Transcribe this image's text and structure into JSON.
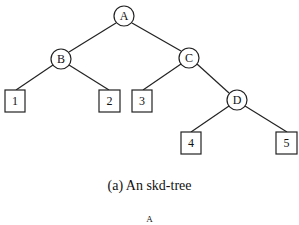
{
  "diagram": {
    "title": "An skd-tree",
    "caption": "(a) An skd-tree",
    "internal_nodes": [
      {
        "id": "A",
        "label": "A",
        "cx": 124,
        "cy": 16
      },
      {
        "id": "B",
        "label": "B",
        "cx": 61,
        "cy": 59
      },
      {
        "id": "C",
        "label": "C",
        "cx": 189,
        "cy": 58
      },
      {
        "id": "D",
        "label": "D",
        "cx": 237,
        "cy": 100
      }
    ],
    "leaf_nodes": [
      {
        "id": "1",
        "label": "1",
        "x": 4,
        "y": 90
      },
      {
        "id": "2",
        "label": "2",
        "x": 98,
        "y": 90
      },
      {
        "id": "3",
        "label": "3",
        "x": 131,
        "y": 90
      },
      {
        "id": "4",
        "label": "4",
        "x": 180,
        "y": 132
      },
      {
        "id": "5",
        "label": "5",
        "x": 276,
        "y": 132
      }
    ],
    "edges": [
      [
        "A",
        "B"
      ],
      [
        "A",
        "C"
      ],
      [
        "B",
        "1"
      ],
      [
        "B",
        "2"
      ],
      [
        "C",
        "3"
      ],
      [
        "C",
        "D"
      ],
      [
        "D",
        "4"
      ],
      [
        "D",
        "5"
      ]
    ],
    "next_figure_partial": "A"
  }
}
